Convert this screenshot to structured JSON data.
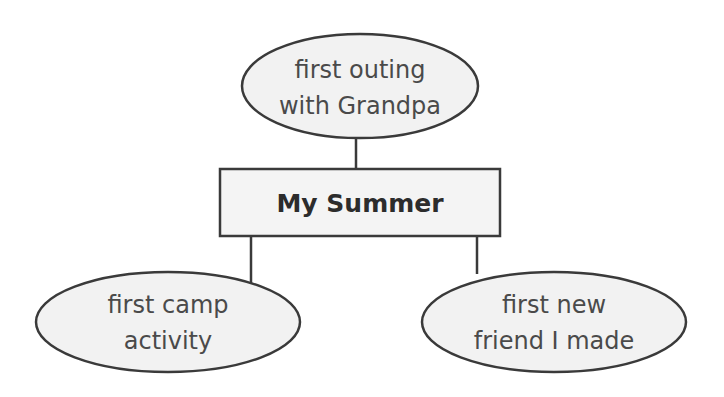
{
  "diagram": {
    "type": "concept-web",
    "colors": {
      "fill": "#f2f2f2",
      "stroke": "#3a3a3a",
      "text": "#4a4a4a",
      "center_text": "#2c2c2c",
      "background": "#ffffff"
    },
    "center": {
      "label": "My Summer"
    },
    "nodes": [
      {
        "id": "top",
        "lines": [
          "first outing",
          "with Grandpa"
        ]
      },
      {
        "id": "left",
        "lines": [
          "first camp",
          "activity"
        ]
      },
      {
        "id": "right",
        "lines": [
          "first new",
          "friend I made"
        ]
      }
    ]
  }
}
